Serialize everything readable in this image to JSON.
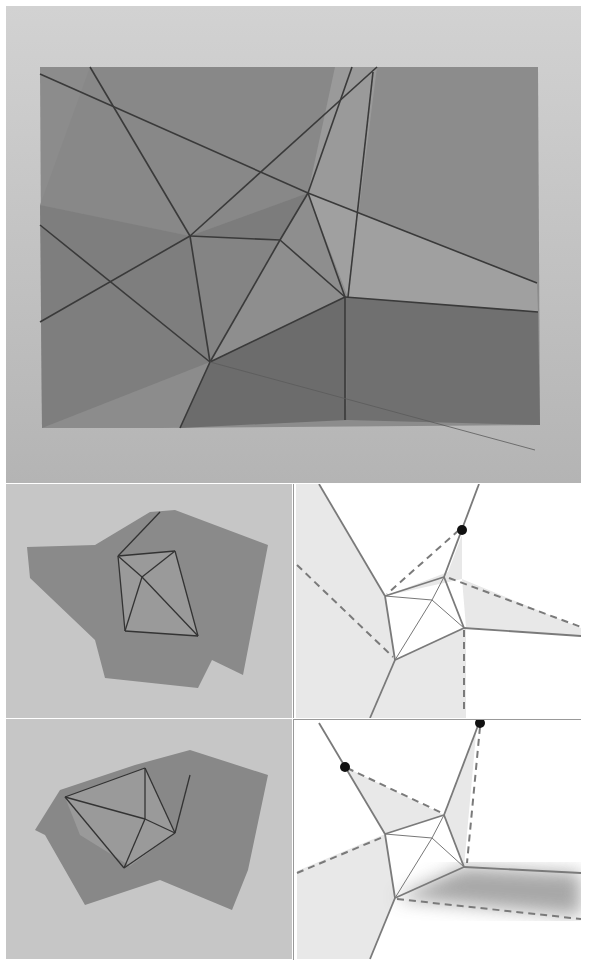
{
  "figure": {
    "panels": [
      {
        "id": "top-photo",
        "kind": "photo",
        "subject": "unfolded paper sheet with crease pattern"
      },
      {
        "id": "row1-photo",
        "kind": "photo",
        "subject": "partially folded paper, state 1"
      },
      {
        "id": "row1-diagram",
        "kind": "diagram",
        "subject": "crease pattern state 1 with dashed fold lines and marker dot"
      },
      {
        "id": "row2-photo",
        "kind": "photo",
        "subject": "partially folded paper, state 2"
      },
      {
        "id": "row2-diagram",
        "kind": "diagram",
        "subject": "crease pattern state 2 with dashed fold lines and two marker dots"
      }
    ],
    "colors": {
      "background": "#c8c8c8",
      "paper": "#8a8a8a",
      "crease": "#444444",
      "diagram_line": "#777777",
      "diagram_shade": "#e6e6e6",
      "marker": "#111111"
    }
  }
}
